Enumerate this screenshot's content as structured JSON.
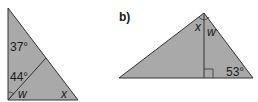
{
  "colors": {
    "fill": "#a9a9a9",
    "stroke": "#333333",
    "text": "#1a1a1a",
    "background": "#ffffff"
  },
  "figure_a": {
    "vertices": {
      "top": [
        8,
        8
      ],
      "bottom_left": [
        8,
        100
      ],
      "bottom_right": [
        78,
        100
      ]
    },
    "inner_segment": {
      "from": [
        8,
        100
      ],
      "to": [
        46,
        58
      ]
    },
    "labels": {
      "angle_top": "37°",
      "angle_inner": "44°",
      "var_w": "w",
      "var_x": "x"
    }
  },
  "figure_b": {
    "part_label": "b)",
    "vertices": {
      "apex": [
        204,
        13
      ],
      "bottom_left": [
        119,
        78
      ],
      "bottom_right": [
        253,
        78
      ]
    },
    "altitude": {
      "from": [
        204,
        13
      ],
      "to": [
        204,
        78
      ]
    },
    "right_angle_marker": {
      "x": 204,
      "y": 69,
      "size": 9
    },
    "labels": {
      "var_x": "x",
      "var_w": "w",
      "angle_bottom_right": "53°"
    }
  }
}
